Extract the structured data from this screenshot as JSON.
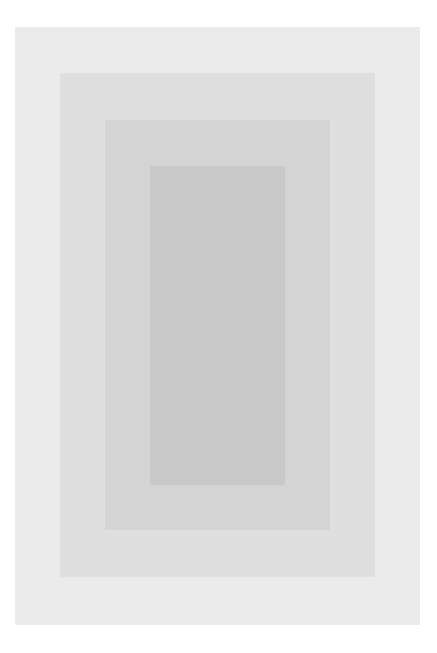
{
  "artwork": {
    "description": "Nested concentric gray rectangles on white background",
    "background_color": "#ffffff",
    "layers": [
      {
        "name": "outer",
        "color": "#ebebeb"
      },
      {
        "name": "second",
        "color": "#dfdfdf"
      },
      {
        "name": "third",
        "color": "#d4d4d4"
      },
      {
        "name": "inner",
        "color": "#c9c9c9"
      }
    ]
  }
}
